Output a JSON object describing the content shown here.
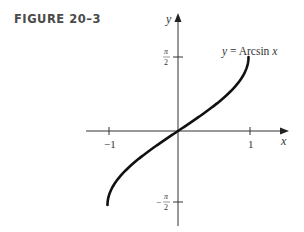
{
  "figure": {
    "label": "FIGURE 20–3"
  },
  "chart_data": {
    "type": "line",
    "title": "",
    "curve_label": "y = Arcsin x",
    "xlabel": "x",
    "ylabel": "y",
    "x_ticks": [
      {
        "value": -1,
        "label": "−1"
      },
      {
        "value": 1,
        "label": "1"
      }
    ],
    "y_ticks": [
      {
        "value": 1.5708,
        "label": "π/2"
      },
      {
        "value": -1.5708,
        "label": "−π/2"
      }
    ],
    "xlim": [
      -1.35,
      1.55
    ],
    "ylim": [
      -2.0,
      2.5
    ],
    "grid": false,
    "legend": "none",
    "series": [
      {
        "name": "y = Arcsin x",
        "x": [
          -1,
          -0.9,
          -0.75,
          -0.5,
          -0.25,
          0,
          0.25,
          0.5,
          0.75,
          0.9,
          1
        ],
        "y": [
          -1.5708,
          -1.1198,
          -0.8481,
          -0.5236,
          -0.2527,
          0,
          0.2527,
          0.5236,
          0.8481,
          1.1198,
          1.5708
        ]
      }
    ]
  },
  "labels": {
    "x_axis": "x",
    "y_axis": "y",
    "tick_neg1": "−1",
    "tick_pos1": "1",
    "pi": "π",
    "two": "2",
    "minus": "−",
    "curve_y": "y",
    "curve_eq": " = Arcsin ",
    "curve_x": "x"
  }
}
